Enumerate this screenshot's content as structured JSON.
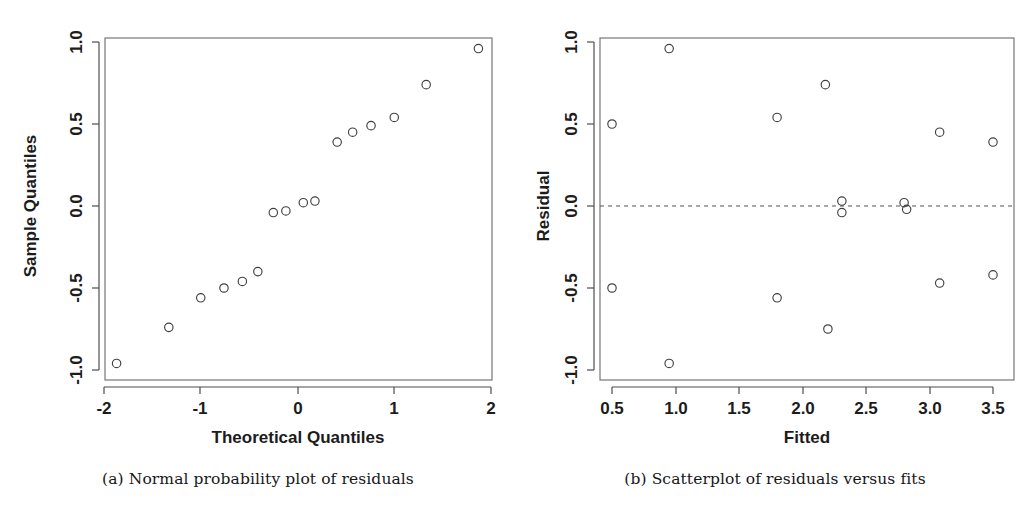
{
  "figure": {
    "background": "#ffffff",
    "panel_count": 2
  },
  "panels": [
    {
      "id": "normal-probability-plot",
      "caption": "(a) Normal probability plot of residuals"
    },
    {
      "id": "residuals-vs-fits-plot",
      "caption": "(b) Scatterplot of residuals versus fits"
    }
  ],
  "chart_data": [
    {
      "type": "scatter",
      "id": "normal-probability-plot",
      "title": "",
      "xlabel": "Theoretical Quantiles",
      "ylabel": "Sample Quantiles",
      "xlim": [
        -2.0,
        2.0
      ],
      "ylim": [
        -1.0,
        1.0
      ],
      "xticks": [
        -2,
        -1,
        0,
        1,
        2
      ],
      "xtick_labels": [
        "-2",
        "-1",
        "0",
        "1",
        "2"
      ],
      "yticks": [
        -1.0,
        -0.5,
        0.0,
        0.5,
        1.0
      ],
      "ytick_labels": [
        "-1.0",
        "-0.5",
        "0.0",
        "0.5",
        "1.0"
      ],
      "grid": false,
      "legend": "none",
      "marker": "open-circle",
      "x": [
        -1.87,
        -1.33,
        -1.0,
        -0.76,
        -0.57,
        -0.41,
        -0.25,
        -0.12,
        0.06,
        0.18,
        0.41,
        0.57,
        0.76,
        1.0,
        1.33,
        1.87
      ],
      "y": [
        -0.96,
        -0.74,
        -0.56,
        -0.5,
        -0.46,
        -0.4,
        -0.04,
        -0.03,
        0.02,
        0.03,
        0.39,
        0.45,
        0.49,
        0.54,
        0.74,
        0.96
      ],
      "n_points": 16
    },
    {
      "type": "scatter",
      "id": "residuals-vs-fits-plot",
      "title": "",
      "xlabel": "Fitted",
      "ylabel": "Residual",
      "xlim": [
        0.32,
        3.68
      ],
      "ylim": [
        -1.0,
        1.0
      ],
      "xticks": [
        0.5,
        1.0,
        1.5,
        2.0,
        2.5,
        3.0,
        3.5
      ],
      "xtick_labels": [
        "0.5",
        "1.0",
        "1.5",
        "2.0",
        "2.5",
        "3.0",
        "3.5"
      ],
      "yticks": [
        -1.0,
        -0.5,
        0.0,
        0.5,
        1.0
      ],
      "ytick_labels": [
        "-1.0",
        "-0.5",
        "0.0",
        "0.5",
        "1.0"
      ],
      "grid": false,
      "legend": "none",
      "marker": "open-circle",
      "reference_line": {
        "orientation": "horizontal",
        "y": 0.0,
        "style": "dashed"
      },
      "x": [
        0.5,
        0.5,
        0.95,
        0.95,
        1.8,
        1.8,
        2.18,
        2.2,
        2.31,
        2.31,
        2.8,
        2.82,
        3.08,
        3.08,
        3.5,
        3.5
      ],
      "y": [
        0.5,
        -0.5,
        0.96,
        -0.96,
        0.54,
        -0.56,
        0.74,
        -0.75,
        0.03,
        -0.04,
        0.02,
        -0.02,
        0.45,
        -0.47,
        0.39,
        -0.42
      ],
      "n_points": 16
    }
  ]
}
